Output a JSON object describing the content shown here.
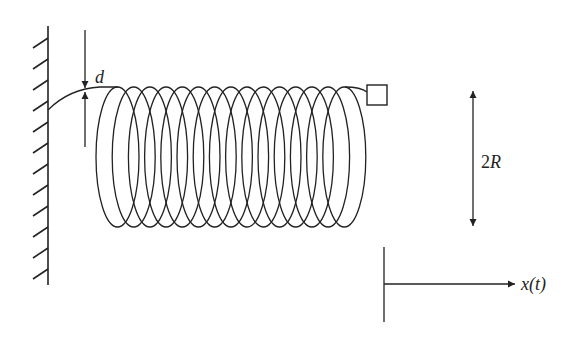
{
  "diagram": {
    "colors": {
      "stroke": "#222222",
      "background": "#ffffff"
    },
    "wall": {
      "x": 48,
      "y_top": 26,
      "y_bottom": 285,
      "hatch_count": 12,
      "hatch_spacing": 21,
      "hatch_dx": -15,
      "hatch_dy": 10
    },
    "spring": {
      "loops": 15,
      "first_left": 96,
      "step": 16.2,
      "loop_width": 43,
      "center_y": 157,
      "half_height": 70
    },
    "wire": {
      "start_x": 48,
      "start_y": 110
    },
    "mass": {
      "x": 367,
      "y": 85,
      "size": 20
    },
    "labels": {
      "d": "d",
      "two_r_num": "2",
      "two_r_var": "R",
      "x_t": "x(t)"
    },
    "d_arrow": {
      "x": 85,
      "y_top": 30,
      "y_bottom": 147,
      "tip_top": 88,
      "tip_bottom": 92
    },
    "radius_arrow": {
      "x": 473,
      "y_top": 91,
      "y_bottom": 226
    },
    "frame": {
      "vx": 384,
      "vy_top": 247,
      "vy_bottom": 322,
      "hy": 284,
      "hx_end": 515
    }
  }
}
